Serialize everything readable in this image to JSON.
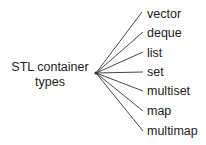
{
  "diagram": {
    "type": "tree-fan",
    "root": {
      "line1": "STL container",
      "line2": "types"
    },
    "origin": {
      "x": 96,
      "y": 73
    },
    "line_color": "#333333",
    "leaves": [
      {
        "label": "vector",
        "end": {
          "x": 142,
          "y": 12
        },
        "top": 7
      },
      {
        "label": "deque",
        "end": {
          "x": 143,
          "y": 32
        },
        "top": 26
      },
      {
        "label": "list",
        "end": {
          "x": 143,
          "y": 52
        },
        "top": 46
      },
      {
        "label": "set",
        "end": {
          "x": 143,
          "y": 72
        },
        "top": 65
      },
      {
        "label": "multiset",
        "end": {
          "x": 143,
          "y": 91
        },
        "top": 84
      },
      {
        "label": "map",
        "end": {
          "x": 143,
          "y": 111
        },
        "top": 104
      },
      {
        "label": "multimap",
        "end": {
          "x": 143,
          "y": 131
        },
        "top": 124
      }
    ]
  }
}
